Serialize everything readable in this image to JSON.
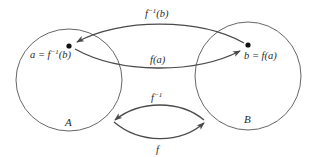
{
  "diagram": {
    "type": "function-inverse-mapping",
    "colors": {
      "stroke": "#555555",
      "arrow": "#4a4a4a",
      "text": "#2a2a2a",
      "background": "#ffffff"
    },
    "sets": [
      {
        "id": "A",
        "label": "A"
      },
      {
        "id": "B",
        "label": "B"
      }
    ],
    "points": {
      "a": {
        "label_lhs": "a = f",
        "label_sup": "−1",
        "label_rhs": "(b)"
      },
      "b": {
        "label": "b = f(a)"
      }
    },
    "arrows": {
      "top": {
        "label_base": "f",
        "label_sup": "−1",
        "label_rhs": "(b)",
        "direction": "b-to-a"
      },
      "middle": {
        "label": "f(a)",
        "direction": "a-to-b"
      },
      "bottom_upper": {
        "label_base": "f",
        "label_sup": "−1",
        "direction": "B-to-A"
      },
      "bottom_lower": {
        "label": "f",
        "direction": "A-to-B"
      }
    }
  }
}
